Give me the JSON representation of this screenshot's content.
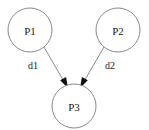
{
  "diagram": {
    "type": "directed-graph",
    "background_color": "#ffffff",
    "node_stroke_color": "#8a8a8a",
    "edge_stroke_color": "#8a8a8a",
    "arrowhead_color": "#111111",
    "text_color": "#1a1a1a",
    "nodes": [
      {
        "id": "p1",
        "label": "P1",
        "cx": 30,
        "cy": 30,
        "r": 22
      },
      {
        "id": "p2",
        "label": "P2",
        "cx": 118,
        "cy": 30,
        "r": 22
      },
      {
        "id": "p3",
        "label": "P3",
        "cx": 74,
        "cy": 106,
        "r": 22
      }
    ],
    "edges": [
      {
        "id": "e1",
        "label": "d1",
        "from": "p1",
        "to": "p3",
        "label_x": 33,
        "label_y": 65,
        "x1": 44,
        "y1": 47,
        "x2": 64,
        "y2": 82
      },
      {
        "id": "e2",
        "label": "d2",
        "from": "p2",
        "to": "p3",
        "label_x": 110,
        "label_y": 65,
        "x1": 104,
        "y1": 47,
        "x2": 84,
        "y2": 82
      }
    ]
  }
}
